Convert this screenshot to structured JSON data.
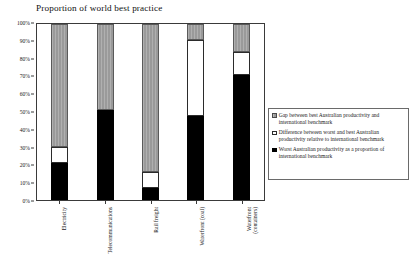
{
  "chart_data": {
    "type": "bar",
    "title": "Proportion of world best practice",
    "xlabel": "",
    "ylabel": "",
    "ylim": [
      0,
      100
    ],
    "stacked": true,
    "grid": false,
    "legend_position": "right",
    "y_ticks": [
      "0%",
      "10%",
      "20%",
      "30%",
      "40%",
      "50%",
      "60%",
      "70%",
      "80%",
      "90%",
      "100%"
    ],
    "y_tick_values": [
      0,
      10,
      20,
      30,
      40,
      50,
      60,
      70,
      80,
      90,
      100
    ],
    "categories": [
      "Electricity",
      "Telecommunications",
      "Rail freight",
      "Waterfront (coal)",
      "Waterfront (containers)"
    ],
    "categories_lines": [
      [
        "Electricity"
      ],
      [
        "Telecommunications"
      ],
      [
        "Rail freight"
      ],
      [
        "Waterfront (coal)"
      ],
      [
        "Waterfront",
        "(containers)"
      ]
    ],
    "series": [
      {
        "name": "Worst Australian productivity as a proportion of international benchmark",
        "color": "#000000",
        "values": [
          21,
          51,
          7,
          48,
          71
        ]
      },
      {
        "name": "Difference between worst and best Australian productivity relative to international benchmark",
        "color": "#ffffff",
        "values": [
          9,
          0,
          9,
          43,
          13
        ]
      },
      {
        "name": "Gap between best Australian productivity and international benchmark",
        "color": "#9a9a9a",
        "values": [
          70,
          49,
          84,
          9,
          16
        ]
      }
    ],
    "cumulative_tops": {
      "black": [
        21,
        51,
        7,
        48,
        71
      ],
      "white": [
        30,
        51,
        16,
        91,
        84
      ],
      "gray": [
        100,
        100,
        100,
        100,
        100
      ]
    }
  },
  "legend": {
    "items": [
      {
        "swatch": "gray",
        "text": "Gap between best Australian productivity and international benchmark"
      },
      {
        "swatch": "white",
        "text": "Difference between worst and best Australian productivity relative to international benchmark"
      },
      {
        "swatch": "black",
        "text": "Worst Australian productivity as a proportion of international benchmark"
      }
    ]
  },
  "colors": {
    "gap_gray": "#9a9a9a",
    "difference_white": "#ffffff",
    "worst_black": "#000000",
    "axis": "#3a3a3a",
    "background": "#ffffff"
  }
}
